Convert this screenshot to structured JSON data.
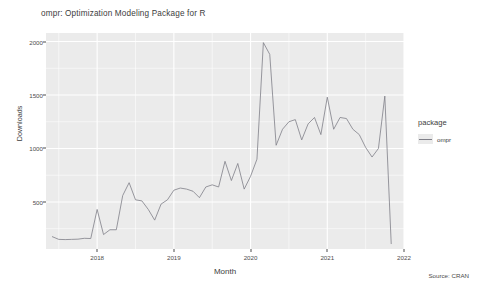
{
  "chart_data": {
    "type": "line",
    "title": "ompr:  Optimization Modeling Package for R",
    "xlabel": "Month",
    "ylabel": "Downloads",
    "caption": "Source: CRAN",
    "grid": true,
    "legend_position": "right",
    "legend_title": "package",
    "series": [
      {
        "name": "ompr",
        "color": "#7f7f88",
        "x": [
          "2017-06",
          "2017-07",
          "2017-08",
          "2017-09",
          "2017-10",
          "2017-11",
          "2017-12",
          "2018-01",
          "2018-02",
          "2018-03",
          "2018-04",
          "2018-05",
          "2018-06",
          "2018-07",
          "2018-08",
          "2018-09",
          "2018-10",
          "2018-11",
          "2018-12",
          "2019-01",
          "2019-02",
          "2019-03",
          "2019-04",
          "2019-05",
          "2019-06",
          "2019-07",
          "2019-08",
          "2019-09",
          "2019-10",
          "2019-11",
          "2019-12",
          "2020-01",
          "2020-02",
          "2020-03",
          "2020-04",
          "2020-05",
          "2020-06",
          "2020-07",
          "2020-08",
          "2020-09",
          "2020-10",
          "2020-11",
          "2020-12",
          "2021-01",
          "2021-02",
          "2021-03",
          "2021-04",
          "2021-05",
          "2021-06",
          "2021-07",
          "2021-08",
          "2021-09",
          "2021-10",
          "2021-11"
        ],
        "values": [
          175,
          150,
          148,
          150,
          152,
          160,
          158,
          430,
          195,
          240,
          240,
          560,
          680,
          520,
          510,
          430,
          330,
          480,
          520,
          610,
          630,
          620,
          600,
          540,
          640,
          660,
          640,
          880,
          700,
          860,
          620,
          740,
          900,
          1990,
          1880,
          1030,
          1180,
          1250,
          1270,
          1080,
          1230,
          1290,
          1130,
          1480,
          1180,
          1290,
          1280,
          1180,
          1130,
          1010,
          920,
          1000,
          1490,
          110
        ]
      }
    ],
    "y_ticks": [
      500,
      1000,
      1500,
      2000
    ],
    "y_tick_labels": [
      "500",
      "1000",
      "1500",
      "2000"
    ],
    "ylim": [
      60,
      2080
    ],
    "x_ticks": [
      "2018",
      "2019",
      "2020",
      "2021",
      "2022"
    ],
    "xlim": [
      "2017-05",
      "2022-01"
    ]
  },
  "legend": {
    "title": "package",
    "items": [
      {
        "label": "ompr",
        "color": "#7f7f88"
      }
    ]
  }
}
